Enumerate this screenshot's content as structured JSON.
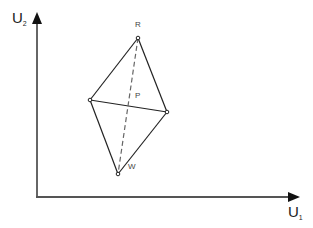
{
  "diagram": {
    "axes": {
      "x_label": "U",
      "x_subscript": "1",
      "y_label": "U",
      "y_subscript": "2",
      "origin": [
        37,
        197
      ],
      "x_end": [
        299,
        197
      ],
      "y_end": [
        37,
        12
      ],
      "color": "#555555"
    },
    "points": {
      "R": {
        "label": "R",
        "pos": [
          138,
          38
        ]
      },
      "L": {
        "label": "",
        "pos": [
          90,
          100
        ]
      },
      "Rt": {
        "label": "",
        "pos": [
          167,
          112
        ]
      },
      "W": {
        "label": "W",
        "pos": [
          118,
          174
        ]
      },
      "P": {
        "label": "P"
      }
    },
    "edges": [
      {
        "from": "R",
        "to": "L",
        "style": "solid"
      },
      {
        "from": "R",
        "to": "Rt",
        "style": "solid"
      },
      {
        "from": "L",
        "to": "W",
        "style": "solid"
      },
      {
        "from": "Rt",
        "to": "W",
        "style": "solid"
      },
      {
        "from": "L",
        "to": "Rt",
        "style": "solid"
      },
      {
        "from": "R",
        "to": "W",
        "style": "dashed"
      }
    ]
  }
}
